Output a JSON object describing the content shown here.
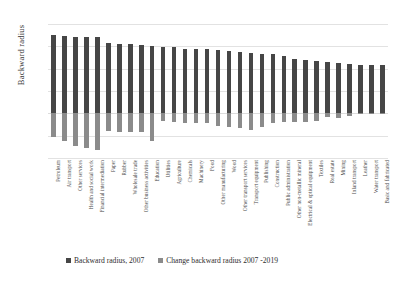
{
  "chart_data": {
    "type": "bar",
    "title": "",
    "xlabel": "",
    "ylabel": "Backward radius",
    "ylim": [
      -0.4,
      0.8
    ],
    "yticks": [
      0.8,
      0.6,
      0.4,
      0.2,
      0.0,
      -0.2,
      -0.4
    ],
    "ytick_labels": [
      "0.8",
      "0.6",
      "0.4",
      "0.2",
      "0.0",
      "-0.2",
      "-0.4"
    ],
    "grid": true,
    "legend_position": "bottom",
    "stacked": true,
    "categories": [
      "Petroleum",
      "Air transport",
      "Other services",
      "Health and social work",
      "Financial intermediation",
      "Paper",
      "Rubber",
      "Wholesale trade",
      "Other business activities",
      "Education",
      "Utilities",
      "Agriculture",
      "Chemicals",
      "Machinery",
      "Food",
      "Other manufacturing",
      "Wood",
      "Other transport services",
      "Transport equipment",
      "Publishing",
      "Construction",
      "Public administration",
      "Other non-metallic mineral",
      "Electrical & optical equipment",
      "Textiles",
      "Real estate",
      "Mining",
      "Inland transport",
      "Leather",
      "Water transport",
      "Basic and fabricated"
    ],
    "series": [
      {
        "name": "Backward radius, 2007",
        "color": "#464646",
        "values": [
          0.7,
          0.69,
          0.68,
          0.68,
          0.68,
          0.63,
          0.62,
          0.62,
          0.61,
          0.6,
          0.59,
          0.59,
          0.58,
          0.58,
          0.58,
          0.57,
          0.56,
          0.55,
          0.54,
          0.53,
          0.53,
          0.51,
          0.49,
          0.48,
          0.47,
          0.46,
          0.45,
          0.44,
          0.43,
          0.43,
          0.43
        ]
      },
      {
        "name": "Change backward radius 2007 -2019",
        "color": "#8b8b8b",
        "values": [
          -0.21,
          -0.25,
          -0.29,
          -0.31,
          -0.33,
          -0.16,
          -0.17,
          -0.17,
          -0.17,
          -0.25,
          -0.07,
          -0.08,
          -0.09,
          -0.09,
          -0.09,
          -0.11,
          -0.12,
          -0.13,
          -0.15,
          -0.12,
          -0.09,
          -0.08,
          -0.08,
          -0.08,
          -0.07,
          -0.03,
          -0.04,
          -0.02,
          -0.01,
          -0.01,
          -0.01
        ]
      }
    ],
    "legend": [
      "Backward radius, 2007",
      "Change backward radius 2007 -2019"
    ]
  }
}
